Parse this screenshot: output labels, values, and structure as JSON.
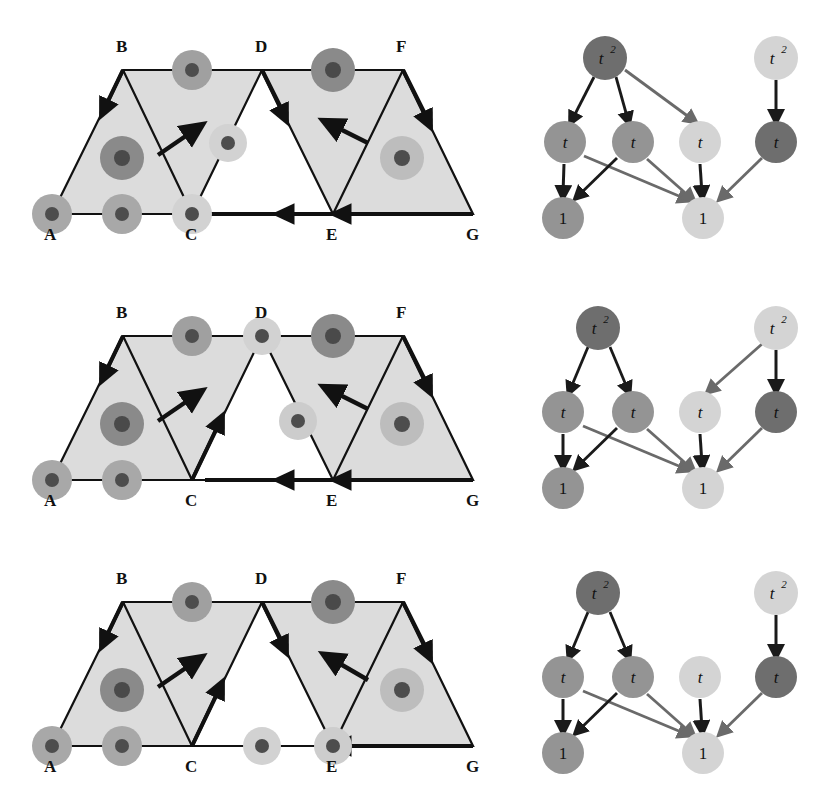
{
  "figure": {
    "rows": [
      {
        "id": "row-1",
        "strip": {
          "vertex_labels": [
            "A",
            "B",
            "C",
            "D",
            "E",
            "F",
            "G"
          ],
          "shaded_triangles": [
            "A-B-C",
            "B-C-D",
            "E-F-G"
          ],
          "unshaded_triangles": [
            "C-D-E"
          ],
          "dots": [
            {
              "name": "dot-at-A",
              "pos": "A",
              "tone": "mid"
            },
            {
              "name": "dot-edge-AC",
              "pos": "edge-A-C",
              "tone": "mid"
            },
            {
              "name": "dot-at-C",
              "pos": "C",
              "tone": "light"
            },
            {
              "name": "dot-interior-ABC",
              "pos": "interior-A-B-C",
              "tone": "dark"
            },
            {
              "name": "dot-edge-BD",
              "pos": "edge-B-D",
              "tone": "mid"
            },
            {
              "name": "dot-edge-CD",
              "pos": "edge-C-D",
              "tone": "light"
            },
            {
              "name": "dot-edge-DF",
              "pos": "edge-D-F",
              "tone": "dark"
            },
            {
              "name": "dot-interior-EFG",
              "pos": "interior-E-F-G",
              "tone": "light"
            }
          ],
          "arrows": [
            {
              "name": "arrow-B-to-A",
              "from": "B",
              "to": "A"
            },
            {
              "name": "arrow-free-up-right",
              "from": "interior",
              "to": "up-right"
            },
            {
              "name": "arrow-D-to-E",
              "from": "D",
              "to": "E"
            },
            {
              "name": "arrow-free-up-left",
              "from": "interior",
              "to": "up-left"
            },
            {
              "name": "arrow-F-to-G",
              "from": "F",
              "to": "G"
            },
            {
              "name": "arrow-E-to-C",
              "from": "E",
              "to": "C"
            },
            {
              "name": "arrow-G-to-E",
              "from": "G",
              "to": "E"
            }
          ]
        },
        "graph": {
          "nodes": [
            {
              "id": "n0",
              "label": "t",
              "sup": "2",
              "tone": "dark",
              "x": 605,
              "y": 58
            },
            {
              "id": "n1",
              "label": "t",
              "sup": "2",
              "tone": "light",
              "x": 776,
              "y": 58
            },
            {
              "id": "n2",
              "label": "t",
              "sup": "",
              "tone": "mid",
              "x": 565,
              "y": 142
            },
            {
              "id": "n3",
              "label": "t",
              "sup": "",
              "tone": "mid",
              "x": 633,
              "y": 142
            },
            {
              "id": "n4",
              "label": "t",
              "sup": "",
              "tone": "light",
              "x": 700,
              "y": 142
            },
            {
              "id": "n5",
              "label": "t",
              "sup": "",
              "tone": "dark",
              "x": 776,
              "y": 142
            },
            {
              "id": "n6",
              "label": "1",
              "sup": "",
              "tone": "mid",
              "x": 563,
              "y": 218
            },
            {
              "id": "n7",
              "label": "1",
              "sup": "",
              "tone": "light",
              "x": 703,
              "y": 218
            }
          ],
          "edges": [
            {
              "from": "n0",
              "to": "n2",
              "tone": "dark"
            },
            {
              "from": "n0",
              "to": "n3",
              "tone": "dark"
            },
            {
              "from": "n0",
              "to": "n4",
              "tone": "mid"
            },
            {
              "from": "n1",
              "to": "n5",
              "tone": "dark"
            },
            {
              "from": "n2",
              "to": "n6",
              "tone": "dark"
            },
            {
              "from": "n2",
              "to": "n7",
              "tone": "mid"
            },
            {
              "from": "n3",
              "to": "n6",
              "tone": "dark"
            },
            {
              "from": "n3",
              "to": "n7",
              "tone": "mid"
            },
            {
              "from": "n4",
              "to": "n7",
              "tone": "dark"
            },
            {
              "from": "n5",
              "to": "n7",
              "tone": "mid"
            }
          ]
        }
      },
      {
        "id": "row-2",
        "strip": {
          "vertex_labels": [
            "A",
            "B",
            "C",
            "D",
            "E",
            "F",
            "G"
          ],
          "shaded_triangles": [
            "A-B-C",
            "B-C-D",
            "E-F-G"
          ],
          "unshaded_triangles": [
            "C-D-E"
          ],
          "dots": [
            {
              "name": "dot-at-A",
              "pos": "A",
              "tone": "mid"
            },
            {
              "name": "dot-edge-AC",
              "pos": "edge-A-C",
              "tone": "mid"
            },
            {
              "name": "dot-interior-ABC",
              "pos": "interior-A-B-C",
              "tone": "dark"
            },
            {
              "name": "dot-edge-BD",
              "pos": "edge-B-D",
              "tone": "mid"
            },
            {
              "name": "dot-at-D",
              "pos": "D",
              "tone": "light"
            },
            {
              "name": "dot-edge-DF",
              "pos": "edge-D-F",
              "tone": "dark"
            },
            {
              "name": "dot-interior-DEF",
              "pos": "interior-D-E-F",
              "tone": "light"
            },
            {
              "name": "dot-interior-EFG",
              "pos": "interior-E-F-G",
              "tone": "light"
            }
          ],
          "arrows": [
            {
              "name": "arrow-B-to-A",
              "from": "B",
              "to": "A"
            },
            {
              "name": "arrow-free-up-right",
              "from": "interior",
              "to": "up-right"
            },
            {
              "name": "arrow-C-to-D",
              "from": "C",
              "to": "D"
            },
            {
              "name": "arrow-free-up-left",
              "from": "interior",
              "to": "up-left"
            },
            {
              "name": "arrow-F-to-G",
              "from": "F",
              "to": "G"
            },
            {
              "name": "arrow-E-to-C",
              "from": "E",
              "to": "C"
            },
            {
              "name": "arrow-G-to-E",
              "from": "G",
              "to": "E"
            }
          ]
        },
        "graph": {
          "nodes": [
            {
              "id": "n0",
              "label": "t",
              "sup": "2",
              "tone": "dark",
              "x": 598,
              "y": 328
            },
            {
              "id": "n1",
              "label": "t",
              "sup": "2",
              "tone": "light",
              "x": 776,
              "y": 328
            },
            {
              "id": "n2",
              "label": "t",
              "sup": "",
              "tone": "mid",
              "x": 563,
              "y": 412
            },
            {
              "id": "n3",
              "label": "t",
              "sup": "",
              "tone": "mid",
              "x": 633,
              "y": 412
            },
            {
              "id": "n4",
              "label": "t",
              "sup": "",
              "tone": "light",
              "x": 700,
              "y": 412
            },
            {
              "id": "n5",
              "label": "t",
              "sup": "",
              "tone": "dark",
              "x": 776,
              "y": 412
            },
            {
              "id": "n6",
              "label": "1",
              "sup": "",
              "tone": "mid",
              "x": 563,
              "y": 488
            },
            {
              "id": "n7",
              "label": "1",
              "sup": "",
              "tone": "light",
              "x": 703,
              "y": 488
            }
          ],
          "edges": [
            {
              "from": "n0",
              "to": "n2",
              "tone": "dark"
            },
            {
              "from": "n0",
              "to": "n3",
              "tone": "dark"
            },
            {
              "from": "n1",
              "to": "n4",
              "tone": "mid"
            },
            {
              "from": "n1",
              "to": "n5",
              "tone": "dark"
            },
            {
              "from": "n2",
              "to": "n6",
              "tone": "dark"
            },
            {
              "from": "n2",
              "to": "n7",
              "tone": "mid"
            },
            {
              "from": "n3",
              "to": "n6",
              "tone": "dark"
            },
            {
              "from": "n3",
              "to": "n7",
              "tone": "mid"
            },
            {
              "from": "n4",
              "to": "n7",
              "tone": "dark"
            },
            {
              "from": "n5",
              "to": "n7",
              "tone": "mid"
            }
          ]
        }
      },
      {
        "id": "row-3",
        "strip": {
          "vertex_labels": [
            "A",
            "B",
            "C",
            "D",
            "E",
            "F",
            "G"
          ],
          "shaded_triangles": [
            "A-B-C",
            "B-C-D",
            "D-E-F",
            "E-F-G"
          ],
          "unshaded_triangles": [
            "C-D-E"
          ],
          "dots": [
            {
              "name": "dot-at-A",
              "pos": "A",
              "tone": "mid"
            },
            {
              "name": "dot-edge-AC",
              "pos": "edge-A-C",
              "tone": "mid"
            },
            {
              "name": "dot-interior-ABC",
              "pos": "interior-A-B-C",
              "tone": "dark"
            },
            {
              "name": "dot-edge-BD",
              "pos": "edge-B-D",
              "tone": "mid"
            },
            {
              "name": "dot-edge-CE",
              "pos": "edge-C-E",
              "tone": "light"
            },
            {
              "name": "dot-at-E",
              "pos": "E",
              "tone": "light"
            },
            {
              "name": "dot-edge-DF",
              "pos": "edge-D-F",
              "tone": "dark"
            },
            {
              "name": "dot-interior-EFG",
              "pos": "interior-E-F-G",
              "tone": "light"
            }
          ],
          "arrows": [
            {
              "name": "arrow-B-to-A",
              "from": "B",
              "to": "A"
            },
            {
              "name": "arrow-free-up-right",
              "from": "interior",
              "to": "up-right"
            },
            {
              "name": "arrow-C-to-D",
              "from": "C",
              "to": "D"
            },
            {
              "name": "arrow-D-to-E",
              "from": "D",
              "to": "E"
            },
            {
              "name": "arrow-free-up-left",
              "from": "interior",
              "to": "up-left"
            },
            {
              "name": "arrow-F-to-G",
              "from": "F",
              "to": "G"
            },
            {
              "name": "arrow-G-to-E",
              "from": "G",
              "to": "E"
            }
          ]
        },
        "graph": {
          "nodes": [
            {
              "id": "n0",
              "label": "t",
              "sup": "2",
              "tone": "dark",
              "x": 598,
              "y": 593
            },
            {
              "id": "n1",
              "label": "t",
              "sup": "2",
              "tone": "light",
              "x": 776,
              "y": 593
            },
            {
              "id": "n2",
              "label": "t",
              "sup": "",
              "tone": "mid",
              "x": 563,
              "y": 677
            },
            {
              "id": "n3",
              "label": "t",
              "sup": "",
              "tone": "mid",
              "x": 633,
              "y": 677
            },
            {
              "id": "n4",
              "label": "t",
              "sup": "",
              "tone": "light",
              "x": 700,
              "y": 677
            },
            {
              "id": "n5",
              "label": "t",
              "sup": "",
              "tone": "dark",
              "x": 776,
              "y": 677
            },
            {
              "id": "n6",
              "label": "1",
              "sup": "",
              "tone": "mid",
              "x": 563,
              "y": 753
            },
            {
              "id": "n7",
              "label": "1",
              "sup": "",
              "tone": "light",
              "x": 703,
              "y": 753
            }
          ],
          "edges": [
            {
              "from": "n0",
              "to": "n2",
              "tone": "dark"
            },
            {
              "from": "n0",
              "to": "n3",
              "tone": "dark"
            },
            {
              "from": "n1",
              "to": "n5",
              "tone": "dark"
            },
            {
              "from": "n2",
              "to": "n6",
              "tone": "dark"
            },
            {
              "from": "n2",
              "to": "n7",
              "tone": "mid"
            },
            {
              "from": "n3",
              "to": "n6",
              "tone": "dark"
            },
            {
              "from": "n3",
              "to": "n7",
              "tone": "mid"
            },
            {
              "from": "n4",
              "to": "n7",
              "tone": "dark"
            },
            {
              "from": "n5",
              "to": "n7",
              "tone": "mid"
            }
          ]
        }
      }
    ]
  },
  "colors": {
    "background": "#ffffff",
    "shade_fill": "#dcdcdc",
    "stroke": "#111111",
    "dot_dark_halo": "#8a8a8a",
    "dot_mid_halo": "#a8a8a8",
    "dot_light_halo": "#d2d2d2",
    "dot_core_dark": "#4d4d4d",
    "dot_core_mid": "#5a5a5a",
    "dot_core_light": "#5a5a5a",
    "node_dark": "#6e6e6e",
    "node_mid": "#949494",
    "node_light": "#d4d4d4",
    "edge_dark": "#1a1a1a",
    "edge_mid": "#6a6a6a"
  },
  "geometry": {
    "strip_vertices": {
      "A": [
        52,
        214
      ],
      "B": [
        123,
        70
      ],
      "C": [
        192,
        214
      ],
      "D": [
        262,
        70
      ],
      "E": [
        333,
        214
      ],
      "F": [
        403,
        70
      ],
      "G": [
        473,
        214
      ]
    },
    "dot_radius_halo": 20,
    "dot_radius_core": 7,
    "node_radius": 21
  }
}
